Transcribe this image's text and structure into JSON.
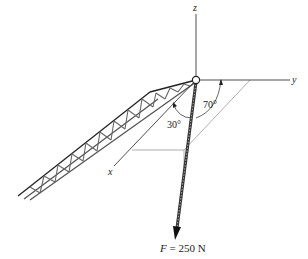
{
  "figure": {
    "axes": {
      "x_label": "x",
      "y_label": "y",
      "z_label": "z"
    },
    "angles": {
      "angle_from_y": "70°",
      "angle_from_x": "30°"
    },
    "force": {
      "symbol": "F",
      "equals": "=",
      "value": "250 N",
      "full_label": "F = 250 N"
    },
    "colors": {
      "line": "#222222",
      "construction": "#999999",
      "truss_fill": "#8a8a8a",
      "background": "#ffffff"
    }
  }
}
